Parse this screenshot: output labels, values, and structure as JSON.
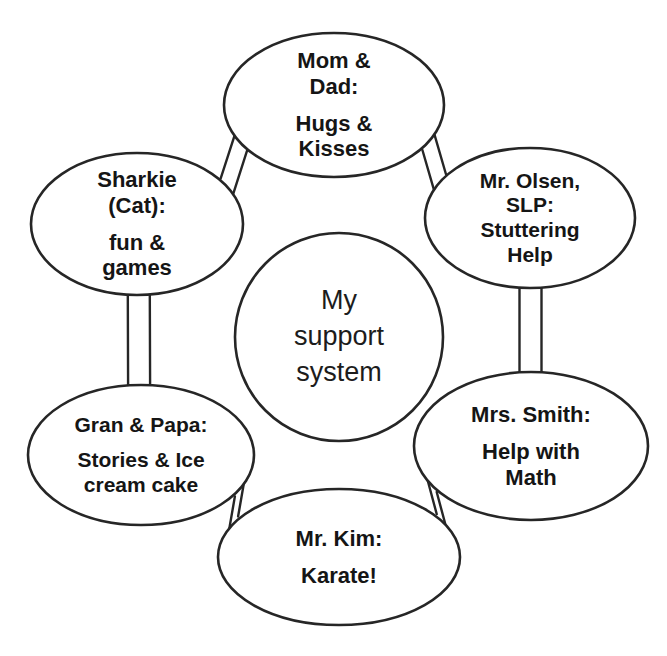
{
  "diagram": {
    "type": "radial-cycle-hub",
    "title_center": "My support system",
    "center": {
      "name": "center-hub",
      "lines": [
        "My",
        "support",
        "system"
      ],
      "shape": "circle",
      "cx": 339,
      "cy": 337,
      "r": 104,
      "font_size": 27,
      "bold": false
    },
    "stroke_color": "#262626",
    "text_color": "#151515",
    "background_color": "#ffffff",
    "nodes": [
      {
        "id": "mom-dad",
        "name": "node-mom-and-dad",
        "lines": [
          "Mom &",
          "Dad:",
          "",
          "Hugs &",
          "Kisses"
        ],
        "cx": 334,
        "cy": 105,
        "rx": 110,
        "ry": 72,
        "font_size": 22,
        "label_w": 200,
        "label_h": 130
      },
      {
        "id": "mr-olsen",
        "name": "node-mr-olsen-slp",
        "lines": [
          "Mr. Olsen,",
          "SLP:",
          "Stuttering",
          "Help"
        ],
        "cx": 530,
        "cy": 218,
        "rx": 105,
        "ry": 70,
        "font_size": 21,
        "label_w": 195,
        "label_h": 125
      },
      {
        "id": "mrs-smith",
        "name": "node-mrs-smith",
        "lines": [
          "Mrs. Smith:",
          "",
          "Help with",
          "Math"
        ],
        "cx": 531,
        "cy": 446,
        "rx": 117,
        "ry": 74,
        "font_size": 22,
        "label_w": 210,
        "label_h": 130
      },
      {
        "id": "mr-kim",
        "name": "node-mr-kim",
        "lines": [
          "Mr. Kim:",
          "",
          "Karate!"
        ],
        "cx": 339,
        "cy": 557,
        "rx": 121,
        "ry": 68,
        "font_size": 22,
        "label_w": 215,
        "label_h": 110
      },
      {
        "id": "gran-papa",
        "name": "node-gran-and-papa",
        "lines": [
          "Gran & Papa:",
          "",
          "Stories & Ice",
          "cream cake"
        ],
        "cx": 141,
        "cy": 455,
        "rx": 113,
        "ry": 70,
        "font_size": 21,
        "label_w": 205,
        "label_h": 125
      },
      {
        "id": "sharkie",
        "name": "node-sharkie-cat",
        "lines": [
          "Sharkie",
          "(Cat):",
          "",
          "fun &",
          "games"
        ],
        "cx": 137,
        "cy": 224,
        "rx": 106,
        "ry": 71,
        "font_size": 22,
        "label_w": 190,
        "label_h": 128
      }
    ],
    "connectors": [
      {
        "name": "connector-sharkie-to-mom-dad",
        "a": "sharkie",
        "b": "mom-dad"
      },
      {
        "name": "connector-mom-dad-to-mr-olsen",
        "a": "mom-dad",
        "b": "mr-olsen"
      },
      {
        "name": "connector-mr-olsen-to-mrs-smith",
        "a": "mr-olsen",
        "b": "mrs-smith"
      },
      {
        "name": "connector-mrs-smith-to-mr-kim",
        "a": "mrs-smith",
        "b": "mr-kim"
      },
      {
        "name": "connector-mr-kim-to-gran-papa",
        "a": "mr-kim",
        "b": "gran-papa"
      },
      {
        "name": "connector-gran-papa-to-sharkie",
        "a": "gran-papa",
        "b": "sharkie"
      }
    ]
  }
}
